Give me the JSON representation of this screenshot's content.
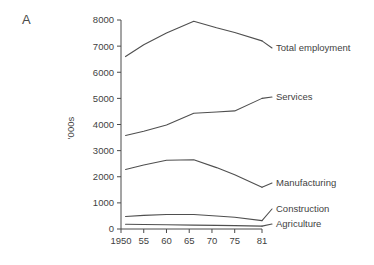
{
  "panel": {
    "label": "A"
  },
  "chart_data": {
    "type": "line",
    "title": "",
    "xlabel": "",
    "ylabel": "'000s",
    "xlim": [
      1950,
      1981
    ],
    "ylim": [
      0,
      8000
    ],
    "grid": false,
    "legend_position": "line-end-labels",
    "x_tick_labels": [
      "1950",
      "55",
      "60",
      "65",
      "70",
      "75",
      "81"
    ],
    "x_tick_values": [
      1950,
      1955,
      1960,
      1965,
      1970,
      1975,
      1981
    ],
    "y_tick_labels": [
      "0",
      "1000",
      "2000",
      "3000",
      "4000",
      "5000",
      "6000",
      "7000",
      "8000"
    ],
    "y_tick_values": [
      0,
      1000,
      2000,
      3000,
      4000,
      5000,
      6000,
      7000,
      8000
    ],
    "x": [
      1951,
      1955,
      1960,
      1966,
      1971,
      1975,
      1981
    ],
    "series": [
      {
        "name": "Total employment",
        "values": [
          6600,
          7050,
          7500,
          7950,
          7700,
          7520,
          7200
        ]
      },
      {
        "name": "Services",
        "values": [
          3580,
          3740,
          3980,
          4430,
          4480,
          4520,
          5000
        ]
      },
      {
        "name": "Manufacturing",
        "values": [
          2280,
          2450,
          2630,
          2650,
          2350,
          2080,
          1600
        ]
      },
      {
        "name": "Construction",
        "values": [
          480,
          520,
          555,
          555,
          500,
          450,
          320
        ]
      },
      {
        "name": "Agriculture",
        "values": [
          180,
          170,
          160,
          150,
          140,
          130,
          110
        ]
      }
    ]
  }
}
